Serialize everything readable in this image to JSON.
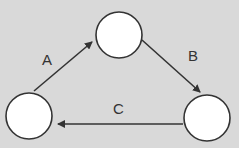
{
  "diagram": {
    "background": "#d9d9d9",
    "node_fill": "#ffffff",
    "stroke": "#333333",
    "nodes": [
      {
        "id": "top",
        "cx": 119,
        "cy": 35,
        "r": 23
      },
      {
        "id": "right",
        "cx": 207,
        "cy": 118,
        "r": 23
      },
      {
        "id": "left",
        "cx": 29,
        "cy": 116,
        "r": 23
      }
    ],
    "edges": [
      {
        "label": "A",
        "from": "left",
        "to": "top"
      },
      {
        "label": "B",
        "from": "top",
        "to": "right"
      },
      {
        "label": "C",
        "from": "right",
        "to": "left"
      }
    ]
  }
}
